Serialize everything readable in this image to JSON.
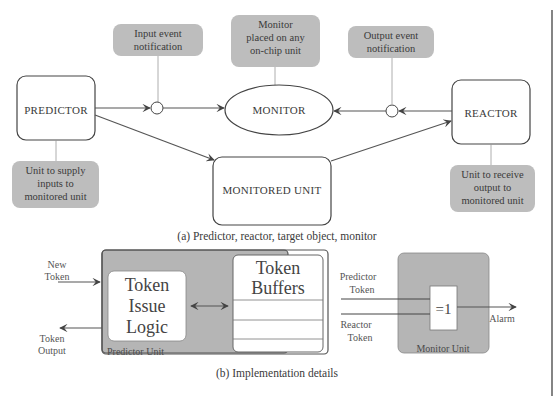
{
  "figure": {
    "part_a": {
      "caption": "(a)  Predictor, reactor, target object, monitor",
      "nodes": {
        "predictor": "PREDICTOR",
        "monitor": "MONITOR",
        "reactor": "REACTOR",
        "monitored_unit": "MONITORED UNIT"
      },
      "notes": {
        "input_event": [
          "Input event",
          "notification"
        ],
        "monitor_placed": [
          "Monitor",
          "placed on any",
          "on-chip unit"
        ],
        "output_event": [
          "Output event",
          "notification"
        ],
        "predictor_desc": [
          "Unit to supply",
          "inputs to",
          "monitored unit"
        ],
        "reactor_desc": [
          "Unit to receive",
          "output to",
          "monitored unit"
        ]
      }
    },
    "part_b": {
      "caption": "(b)  Implementation details",
      "predictor_unit": {
        "label": "Predictor Unit",
        "issue_logic": [
          "Token",
          "Issue",
          "Logic"
        ],
        "buffers": [
          "Token",
          "Buffers"
        ],
        "buffer_rows": 3
      },
      "inputs": {
        "new_token": [
          "New",
          "Token"
        ],
        "token_output": [
          "Token",
          "Output"
        ]
      },
      "monitor_unit": {
        "label": "Monitor Unit",
        "gate": "=1",
        "predictor_token": [
          "Predictor",
          "Token"
        ],
        "reactor_token": [
          "Reactor",
          "Token"
        ],
        "alarm": "Alarm"
      }
    },
    "colors": {
      "note_fill": "#bdbdbd",
      "unit_fill": "#b5b5b5",
      "stroke": "#444444"
    }
  }
}
